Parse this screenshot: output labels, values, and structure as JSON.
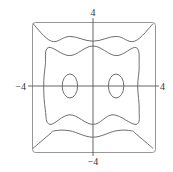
{
  "chart_data": {
    "type": "contour",
    "title": "",
    "xlabel": "",
    "ylabel": "",
    "xlim": [
      -4,
      4
    ],
    "ylim": [
      -4,
      4
    ],
    "grid": false,
    "legend": null,
    "tick_labels": {
      "x_left": "−4",
      "x_right": "4",
      "y_top": "4",
      "y_bottom": "−4"
    },
    "contours": [
      {
        "name": "outer-level",
        "description": "open curves entering from the four corners, wavy along top and bottom",
        "segments": [
          {
            "part": "top",
            "points": [
              [
                -3.9,
                3.9
              ],
              [
                -2.7,
                2.8
              ],
              [
                -1.5,
                3.1
              ],
              [
                0,
                2.8
              ],
              [
                1.5,
                3.1
              ],
              [
                2.7,
                2.8
              ],
              [
                3.9,
                3.9
              ]
            ]
          },
          {
            "part": "bottom",
            "points": [
              [
                -3.9,
                -3.9
              ],
              [
                -2.8,
                -3.0
              ],
              [
                -2.5,
                -2.8
              ],
              [
                -1.5,
                -2.8
              ],
              [
                0,
                -3.2
              ],
              [
                1.5,
                -2.8
              ],
              [
                2.5,
                -2.8
              ],
              [
                2.8,
                -3.0
              ],
              [
                3.9,
                -3.9
              ]
            ]
          }
        ]
      },
      {
        "name": "middle-level",
        "description": "closed wavy rectangle-like curve",
        "points": [
          [
            -2.9,
            2.4
          ],
          [
            -1.5,
            1.9
          ],
          [
            0,
            2.5
          ],
          [
            1.5,
            1.9
          ],
          [
            2.8,
            2.4
          ],
          [
            3.0,
            1.3
          ],
          [
            2.9,
            0
          ],
          [
            3.0,
            -1.5
          ],
          [
            2.8,
            -2.4
          ],
          [
            1.3,
            -1.8
          ],
          [
            0,
            -2.4
          ],
          [
            -1.5,
            -1.8
          ],
          [
            -2.8,
            -2.4
          ],
          [
            -3.1,
            -1.5
          ],
          [
            -3.2,
            0
          ],
          [
            -3.1,
            1.3
          ]
        ]
      },
      {
        "name": "inner-level-left",
        "description": "small ellipse left of origin",
        "center": [
          -1.5,
          0
        ],
        "radii": [
          0.5,
          0.75
        ]
      },
      {
        "name": "inner-level-right",
        "description": "small ellipse right of origin",
        "center": [
          1.5,
          0
        ],
        "radii": [
          0.5,
          0.75
        ]
      }
    ],
    "frame": {
      "shape": "rounded-square",
      "bounds": [
        -3.9,
        3.9
      ]
    }
  },
  "colors": {
    "contour": "#6e6e6e",
    "axis": "#555555",
    "frame": "#8a8a8a",
    "label": "#333333",
    "background": "#ffffff"
  }
}
